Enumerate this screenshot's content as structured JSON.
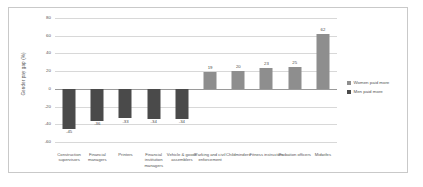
{
  "chart_data": {
    "type": "bar",
    "title": "",
    "xlabel": "",
    "ylabel": "Gender pay gap (%)",
    "ylim": [
      -60,
      80
    ],
    "yticks": [
      80,
      60,
      40,
      20,
      0,
      -20,
      -40,
      -60
    ],
    "grid": true,
    "legend_position": "right",
    "categories": [
      "Construction supervisors",
      "Financial managers",
      "Printers",
      "Financial institution managers",
      "Vehicle & goods assemblers",
      "Parking and civil enforcement",
      "Childminders",
      "Fitness instructors",
      "Probation officers",
      "Midwifes"
    ],
    "values": [
      -45,
      -36,
      -33,
      -34,
      -34,
      19,
      20,
      23,
      25,
      62
    ],
    "value_labels": [
      "-45",
      "-36",
      "-33",
      "-34",
      "-34",
      "19",
      "20",
      "23",
      "25",
      "62"
    ],
    "series": [
      {
        "name": "Men paid more",
        "color": "#4a4a4a"
      },
      {
        "name": "Women paid more",
        "color": "#8e8e8e"
      }
    ]
  },
  "legend": {
    "items": [
      {
        "label": "Women paid more",
        "color": "#8e8e8e"
      },
      {
        "label": "Men paid more",
        "color": "#4a4a4a"
      }
    ]
  }
}
